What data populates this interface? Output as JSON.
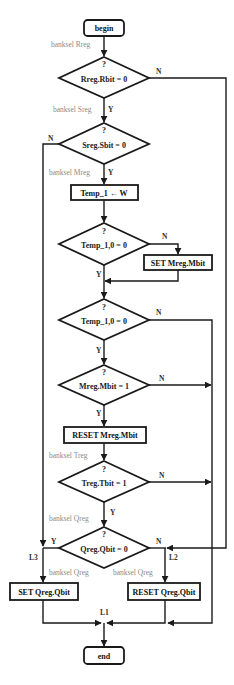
{
  "terminals": {
    "begin": "begin",
    "end": "end"
  },
  "decisions": [
    {
      "q": "?",
      "text": "Rreg.Rbit = 0",
      "yes": "Y",
      "no": "N"
    },
    {
      "q": "?",
      "text": "Sreg.Sbit = 0",
      "yes": "Y",
      "no": "N"
    },
    {
      "q": "?",
      "text": "Temp_1,0 = 0",
      "yes": "Y",
      "no": "N"
    },
    {
      "q": "?",
      "text": "Temp_1,0 = 0",
      "yes": "Y",
      "no": "N"
    },
    {
      "q": "?",
      "text": "Mreg.Mbit = 1",
      "yes": "Y",
      "no": "N"
    },
    {
      "q": "?",
      "text": "Treg.Tbit = 1",
      "yes": "Y",
      "no": "N"
    },
    {
      "q": "?",
      "text": "Qreg.Qbit  = 0",
      "yes": "Y",
      "no": "N"
    }
  ],
  "processes": {
    "temp_assign": "Temp_1 ← W",
    "set_mbit": "SET Mreg.Mbit",
    "reset_mbit": "RESET Mreg.Mbit",
    "set_qbit": "SET Qreg.Qbit",
    "reset_qbit": "RESET Qreg.Qbit"
  },
  "annotations": {
    "banksel_rreg": "banksel Rreg",
    "banksel_sreg": "banksel Sreg",
    "banksel_mreg": "banksel Mreg",
    "banksel_treg": "banksel Treg",
    "banksel_qreg_top": "banksel Qreg",
    "banksel_qreg_left": "banksel Qreg",
    "banksel_qreg_right": "banksel Qreg"
  },
  "labels": {
    "l1": "L1",
    "l2": "L2",
    "l3": "L3"
  },
  "colors": {
    "stroke": "#1a1a1a",
    "annotation": "#8a8a8a",
    "background": "#ffffff"
  }
}
